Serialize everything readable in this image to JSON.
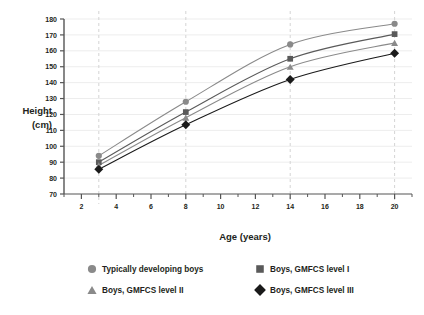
{
  "chart_data": {
    "type": "line",
    "title": "",
    "subtitle": "",
    "xlabel": "Age (years)",
    "ylabel": "Height\n(cm)",
    "ylabel_line1": "Height",
    "ylabel_line2": "(cm)",
    "x": [
      3,
      8,
      14,
      20
    ],
    "xlim": [
      1,
      21
    ],
    "ylim": [
      70,
      180
    ],
    "xticks": [
      2,
      4,
      6,
      8,
      10,
      12,
      14,
      16,
      18,
      20
    ],
    "xtick_labels": [
      "2",
      "4",
      "6",
      "8",
      "10",
      "12",
      "14",
      "16",
      "18",
      "20"
    ],
    "xminor_ticks": [
      1,
      3,
      5,
      7,
      9,
      11,
      13,
      15,
      17,
      19,
      21
    ],
    "yticks": [
      70,
      80,
      90,
      100,
      110,
      120,
      130,
      140,
      150,
      160,
      170,
      180
    ],
    "ytick_labels": [
      "70",
      "80",
      "90",
      "100",
      "110",
      "120",
      "130",
      "140",
      "150",
      "160",
      "170",
      "180"
    ],
    "grid": {
      "horizontal": true,
      "horizontal_color": "#ededed",
      "vertical_dashed": true,
      "vertical_dashed_at": [
        3,
        8,
        14,
        20
      ],
      "vertical_dashed_color": "#d4d4d4"
    },
    "legend_position": "bottom",
    "series": [
      {
        "name": "Typically developing boys",
        "marker": "circle",
        "color": "#8a8a8a",
        "line_color": "#8a8a8a",
        "values": [
          94,
          128,
          164,
          177
        ]
      },
      {
        "name": "Boys, GMFCS level I",
        "marker": "square",
        "color": "#5a5a5a",
        "line_color": "#5a5a5a",
        "values": [
          90,
          121.5,
          155,
          170.5
        ]
      },
      {
        "name": "Boys, GMFCS level II",
        "marker": "triangle",
        "color": "#8a8a8a",
        "line_color": "#8a8a8a",
        "values": [
          88,
          118,
          150,
          165
        ]
      },
      {
        "name": "Boys, GMFCS level III",
        "marker": "diamond",
        "color": "#1a1a1a",
        "line_color": "#1a1a1a",
        "values": [
          85.5,
          113.5,
          142,
          158.5
        ]
      }
    ]
  },
  "legend": {
    "items": [
      {
        "label": "Typically developing boys",
        "marker": "circle",
        "color": "#8a8a8a"
      },
      {
        "label": "Boys, GMFCS level I",
        "marker": "square",
        "color": "#5a5a5a"
      },
      {
        "label": "Boys, GMFCS level II",
        "marker": "triangle",
        "color": "#8a8a8a"
      },
      {
        "label": "Boys, GMFCS level III",
        "marker": "diamond",
        "color": "#1a1a1a"
      }
    ]
  },
  "axes": {
    "x_title": "Age (years)",
    "y_title_line1": "Height",
    "y_title_line2": "(cm)",
    "axis_color": "#555555"
  }
}
